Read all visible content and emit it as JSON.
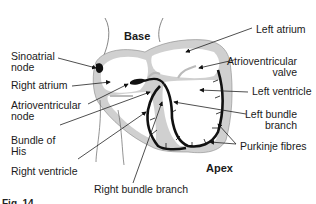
{
  "diagram": {
    "type": "anatomical",
    "colors": {
      "wall": "#cfcfcf",
      "conduction": "#111111",
      "outline": "#555555",
      "text": "#1a1a1a"
    },
    "region_labels": {
      "base": "Base",
      "apex": "Apex"
    },
    "labels_left": [
      {
        "id": "sinoatrial-node",
        "text": "Sinoatrial\nnode"
      },
      {
        "id": "right-atrium",
        "text": "Right atrium"
      },
      {
        "id": "atrioventricular-node",
        "text": "Atrioventricular\nnode"
      },
      {
        "id": "bundle-of-his",
        "text": "Bundle of\nHis"
      },
      {
        "id": "right-ventricle",
        "text": "Right ventricle"
      }
    ],
    "labels_right": [
      {
        "id": "left-atrium",
        "text": "Left atrium"
      },
      {
        "id": "atrioventricular-valve",
        "text": "Atrioventricular\nvalve"
      },
      {
        "id": "left-ventricle",
        "text": "Left ventricle"
      },
      {
        "id": "left-bundle-branch",
        "text": "Left bundle\nbranch"
      },
      {
        "id": "purkinje-fibres",
        "text": "Purkinje fibres"
      }
    ],
    "labels_bottom": [
      {
        "id": "right-bundle-branch",
        "text": "Right bundle branch"
      }
    ],
    "caption": "Fig. 14"
  }
}
